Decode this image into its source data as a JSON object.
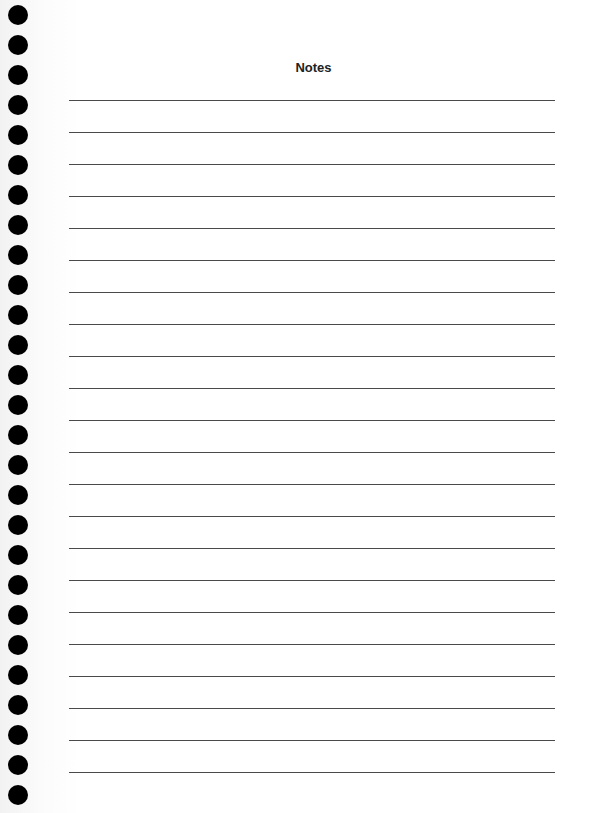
{
  "page": {
    "title": "Notes",
    "ruled_line_count": 22,
    "punch_hole_count": 27,
    "line_color": "#4a4a4a",
    "hole_color": "#000000"
  }
}
